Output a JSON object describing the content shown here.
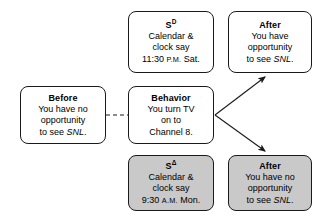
{
  "diagram": {
    "type": "three-term-contingency",
    "colors": {
      "shaded_fill": "#c9c9c9",
      "unshaded_fill": "#ffffff",
      "stroke": "#1a1a1a"
    },
    "boxes": [
      {
        "id": "sd",
        "role": "discriminative-stimulus-sd",
        "shaded": false,
        "title_prefix": "S",
        "title_superscript": "D",
        "lines": [
          "Calendar &",
          "clock say",
          "11:30 P.M. Sat."
        ],
        "time_value": "11:30",
        "time_period": "P.M.",
        "day": "Sat."
      },
      {
        "id": "after-up",
        "role": "after-reinforcement",
        "shaded": false,
        "title": "After",
        "lines": [
          "You have",
          "opportunity",
          "to see SNL."
        ],
        "italic_term": "SNL"
      },
      {
        "id": "before",
        "role": "before-condition",
        "shaded": false,
        "title": "Before",
        "lines": [
          "You have no",
          "opportunity",
          "to see SNL."
        ],
        "italic_term": "SNL"
      },
      {
        "id": "behavior",
        "role": "behavior",
        "shaded": false,
        "title": "Behavior",
        "lines": [
          "You turn TV",
          "on to",
          "Channel 8."
        ]
      },
      {
        "id": "s-delta",
        "role": "discriminative-stimulus-s-delta",
        "shaded": true,
        "title_prefix": "S",
        "title_superscript": "Δ",
        "lines": [
          "Calendar &",
          "clock say",
          "9:30 A.M. Mon."
        ],
        "time_value": "9:30",
        "time_period": "A.M.",
        "day": "Mon."
      },
      {
        "id": "after-dn",
        "role": "after-extinction",
        "shaded": true,
        "title": "After",
        "lines": [
          "You have no",
          "opportunity",
          "to see SNL."
        ],
        "italic_term": "SNL"
      }
    ],
    "connectors": [
      {
        "id": "before-to-behavior",
        "style": "dashed",
        "arrow": false,
        "from": "before",
        "to": "behavior"
      },
      {
        "id": "behavior-to-after-up",
        "style": "solid",
        "arrow": true,
        "from": "behavior",
        "to": "after-up"
      },
      {
        "id": "behavior-to-after-dn",
        "style": "solid",
        "arrow": true,
        "from": "behavior",
        "to": "after-dn"
      }
    ]
  }
}
